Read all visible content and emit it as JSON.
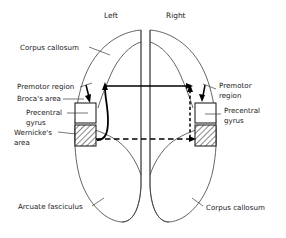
{
  "figure": {
    "headers": {
      "left": "Left",
      "right": "Right"
    },
    "labels": {
      "corpus_callosum_top": "Corpus callosum",
      "premotor_region_left": "Premotor region",
      "brocas_area": "Broca's area",
      "precentral_gyrus_left_line1": "Precentral",
      "precentral_gyrus_left_line2": "gyrus",
      "wernickes_area_line1": "Wernicke's",
      "wernickes_area_line2": "area",
      "arcuate_fasciculus": "Arcuate fasciculus",
      "premotor_region_right_line1": "Premotor",
      "premotor_region_right_line2": "region",
      "precentral_gyrus_right_line1": "Precentral",
      "precentral_gyrus_right_line2": "gyrus",
      "corpus_callosum_bottom": "Corpus callosum"
    },
    "colors": {
      "outline": "#3d3d3d",
      "text": "#1a1a1a",
      "arrow": "#000000",
      "background": "#ffffff",
      "box_fill": "#ffffff"
    }
  }
}
